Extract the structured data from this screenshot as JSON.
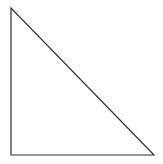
{
  "diagram": {
    "shape": "right-triangle",
    "stroke_color": "#333333",
    "fill_color": "#ffffff",
    "background": "#ffffff",
    "vertices": {
      "top": [
        11,
        8
      ],
      "bottom_left": [
        11,
        155
      ],
      "bottom_right": [
        154,
        155
      ]
    }
  }
}
